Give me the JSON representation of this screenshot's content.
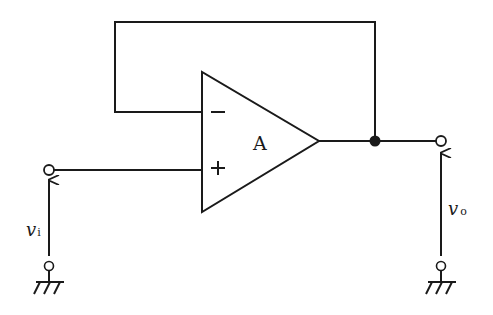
{
  "diagram": {
    "amplifier": {
      "label": "A",
      "inverting_input_symbol": "−",
      "noninverting_input_symbol": "+"
    },
    "input": {
      "voltage_label": "v",
      "voltage_subscript": "i"
    },
    "output": {
      "voltage_label": "v",
      "voltage_subscript": "o"
    },
    "colors": {
      "line": "#1a1a1a",
      "background": "#ffffff"
    }
  }
}
